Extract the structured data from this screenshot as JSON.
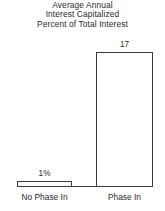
{
  "chart_data": {
    "type": "bar",
    "title": "Average Annual Interest Capitalized Percent of Total Interest",
    "title_lines": [
      "Average Annual",
      "Interest Capitalized",
      "Percent of Total Interest"
    ],
    "categories": [
      "No Phase In",
      "Phase In"
    ],
    "values": [
      1,
      17
    ],
    "value_labels": [
      "1%",
      "17"
    ],
    "xlabel": "",
    "ylabel": "",
    "ylim": [
      0,
      19
    ],
    "grid": false,
    "legend": false,
    "bar_fill_color": "#ffffff",
    "bar_outline_color": "#3b3b3b",
    "text_color": "#2a2a2a",
    "background_color": "#ffffff"
  }
}
